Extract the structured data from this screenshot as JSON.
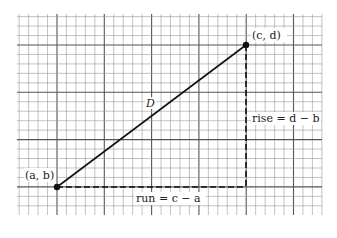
{
  "diagram": {
    "type": "slope-triangle-on-grid",
    "grid": {
      "minor_color": "#9a9a9a",
      "major_color": "#555555",
      "minor_cells_per_major": 5
    },
    "points": [
      {
        "id": "start",
        "label": "(a, b)"
      },
      {
        "id": "end",
        "label": "(c, d)"
      }
    ],
    "segment_label": "D",
    "run_label": "run = c − a",
    "rise_label": "rise = d − b"
  }
}
